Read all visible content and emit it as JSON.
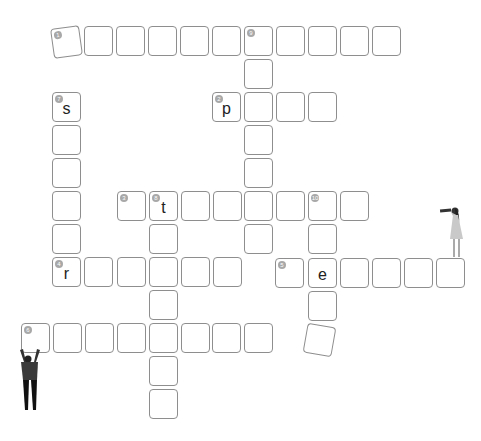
{
  "puzzle": {
    "type": "crossword",
    "cell_size": 29,
    "colors": {
      "border": "#8e8e8e",
      "number_badge": "#a8a8a8",
      "text": "#222222"
    },
    "cells": [
      {
        "id": "c1-1",
        "x": 52,
        "y": 27,
        "num": "1",
        "letter": "",
        "rotate": -8
      },
      {
        "id": "c1-2",
        "x": 84,
        "y": 26,
        "num": "",
        "letter": ""
      },
      {
        "id": "c1-3",
        "x": 116,
        "y": 26,
        "num": "",
        "letter": ""
      },
      {
        "id": "c1-4",
        "x": 148,
        "y": 26,
        "num": "",
        "letter": ""
      },
      {
        "id": "c1-5",
        "x": 180,
        "y": 26,
        "num": "",
        "letter": ""
      },
      {
        "id": "c1-6",
        "x": 212,
        "y": 26,
        "num": "",
        "letter": ""
      },
      {
        "id": "c1-7",
        "x": 244,
        "y": 26,
        "num": "9",
        "letter": ""
      },
      {
        "id": "c1-8",
        "x": 276,
        "y": 26,
        "num": "",
        "letter": ""
      },
      {
        "id": "c1-9",
        "x": 308,
        "y": 26,
        "num": "",
        "letter": ""
      },
      {
        "id": "c1-10",
        "x": 340,
        "y": 26,
        "num": "",
        "letter": ""
      },
      {
        "id": "c1-11",
        "x": 372,
        "y": 26,
        "num": "",
        "letter": ""
      },
      {
        "id": "c9-2",
        "x": 244,
        "y": 59,
        "num": "",
        "letter": ""
      },
      {
        "id": "c7-1",
        "x": 52,
        "y": 92,
        "num": "7",
        "letter": "s"
      },
      {
        "id": "c2-1",
        "x": 212,
        "y": 92,
        "num": "2",
        "letter": "p"
      },
      {
        "id": "c2-2",
        "x": 244,
        "y": 92,
        "num": "",
        "letter": ""
      },
      {
        "id": "c2-3",
        "x": 276,
        "y": 92,
        "num": "",
        "letter": ""
      },
      {
        "id": "c2-4",
        "x": 308,
        "y": 92,
        "num": "",
        "letter": ""
      },
      {
        "id": "c7-2",
        "x": 52,
        "y": 125,
        "num": "",
        "letter": ""
      },
      {
        "id": "c9-4",
        "x": 244,
        "y": 125,
        "num": "",
        "letter": ""
      },
      {
        "id": "c7-3",
        "x": 52,
        "y": 158,
        "num": "",
        "letter": ""
      },
      {
        "id": "c9-5",
        "x": 244,
        "y": 158,
        "num": "",
        "letter": ""
      },
      {
        "id": "c7-4",
        "x": 52,
        "y": 191,
        "num": "",
        "letter": ""
      },
      {
        "id": "c3-1",
        "x": 117,
        "y": 191,
        "num": "3",
        "letter": ""
      },
      {
        "id": "c3-2",
        "x": 149,
        "y": 191,
        "num": "8",
        "letter": "t"
      },
      {
        "id": "c3-3",
        "x": 181,
        "y": 191,
        "num": "",
        "letter": ""
      },
      {
        "id": "c3-4",
        "x": 213,
        "y": 191,
        "num": "",
        "letter": ""
      },
      {
        "id": "c3-5",
        "x": 244,
        "y": 191,
        "num": "",
        "letter": ""
      },
      {
        "id": "c3-6",
        "x": 276,
        "y": 191,
        "num": "",
        "letter": ""
      },
      {
        "id": "c3-7",
        "x": 308,
        "y": 191,
        "num": "10",
        "letter": ""
      },
      {
        "id": "c3-8",
        "x": 340,
        "y": 191,
        "num": "",
        "letter": ""
      },
      {
        "id": "c7-5",
        "x": 52,
        "y": 224,
        "num": "",
        "letter": ""
      },
      {
        "id": "c8-2",
        "x": 149,
        "y": 224,
        "num": "",
        "letter": ""
      },
      {
        "id": "c9-7",
        "x": 244,
        "y": 224,
        "num": "",
        "letter": ""
      },
      {
        "id": "c10-2",
        "x": 308,
        "y": 224,
        "num": "",
        "letter": ""
      },
      {
        "id": "c4-1",
        "x": 52,
        "y": 257,
        "num": "4",
        "letter": "r"
      },
      {
        "id": "c4-2",
        "x": 84,
        "y": 257,
        "num": "",
        "letter": ""
      },
      {
        "id": "c4-3",
        "x": 117,
        "y": 257,
        "num": "",
        "letter": ""
      },
      {
        "id": "c4-4",
        "x": 149,
        "y": 257,
        "num": "",
        "letter": ""
      },
      {
        "id": "c4-5",
        "x": 181,
        "y": 257,
        "num": "",
        "letter": ""
      },
      {
        "id": "c4-6",
        "x": 213,
        "y": 257,
        "num": "",
        "letter": ""
      },
      {
        "id": "c5-1",
        "x": 275,
        "y": 258,
        "num": "5",
        "letter": ""
      },
      {
        "id": "c5-2",
        "x": 308,
        "y": 258,
        "num": "",
        "letter": "e"
      },
      {
        "id": "c5-3",
        "x": 340,
        "y": 258,
        "num": "",
        "letter": ""
      },
      {
        "id": "c5-4",
        "x": 372,
        "y": 258,
        "num": "",
        "letter": ""
      },
      {
        "id": "c5-5",
        "x": 404,
        "y": 258,
        "num": "",
        "letter": ""
      },
      {
        "id": "c5-6",
        "x": 436,
        "y": 258,
        "num": "",
        "letter": ""
      },
      {
        "id": "c8-4",
        "x": 149,
        "y": 290,
        "num": "",
        "letter": ""
      },
      {
        "id": "c10-4",
        "x": 308,
        "y": 291,
        "num": "",
        "letter": ""
      },
      {
        "id": "c6-1",
        "x": 21,
        "y": 323,
        "num": "6",
        "letter": ""
      },
      {
        "id": "c6-2",
        "x": 53,
        "y": 323,
        "num": "",
        "letter": ""
      },
      {
        "id": "c6-3",
        "x": 85,
        "y": 323,
        "num": "",
        "letter": ""
      },
      {
        "id": "c6-4",
        "x": 117,
        "y": 323,
        "num": "",
        "letter": ""
      },
      {
        "id": "c6-5",
        "x": 149,
        "y": 323,
        "num": "",
        "letter": ""
      },
      {
        "id": "c6-6",
        "x": 181,
        "y": 323,
        "num": "",
        "letter": ""
      },
      {
        "id": "c6-7",
        "x": 212,
        "y": 323,
        "num": "",
        "letter": ""
      },
      {
        "id": "c6-8",
        "x": 244,
        "y": 323,
        "num": "",
        "letter": ""
      },
      {
        "id": "c10-5",
        "x": 305,
        "y": 325,
        "num": "",
        "letter": "",
        "rotate": 10
      },
      {
        "id": "c8-6",
        "x": 149,
        "y": 356,
        "num": "",
        "letter": ""
      },
      {
        "id": "c8-7",
        "x": 149,
        "y": 389,
        "num": "",
        "letter": ""
      }
    ]
  },
  "illustrations": [
    {
      "name": "woman-with-telescope",
      "x": 440,
      "y": 203
    },
    {
      "name": "man-holding-tile",
      "x": 18,
      "y": 348
    }
  ]
}
